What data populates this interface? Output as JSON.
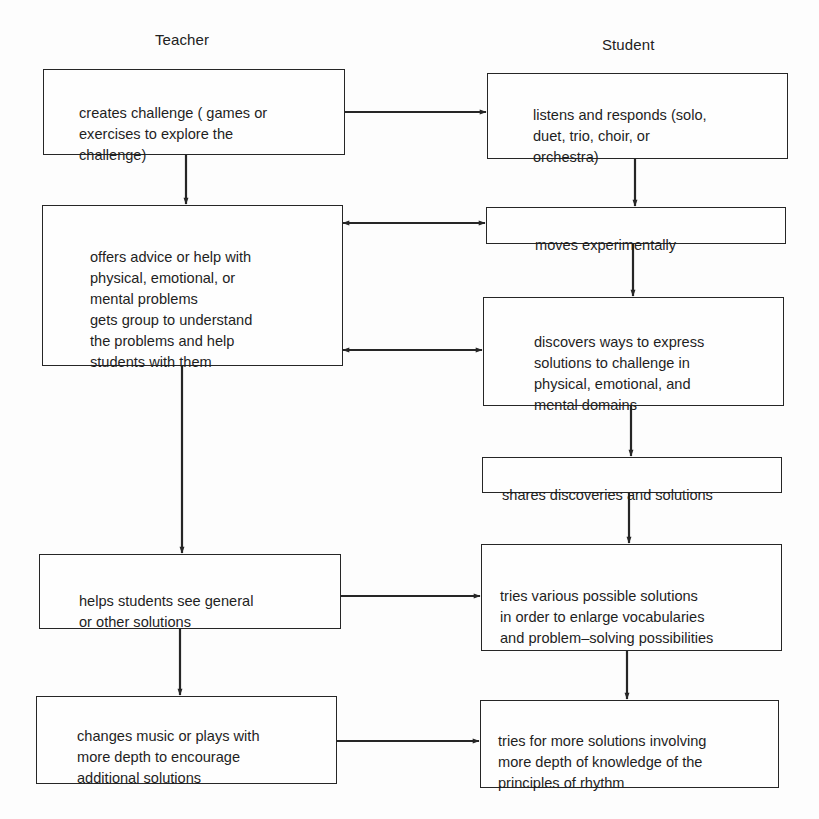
{
  "diagram": {
    "columns": {
      "teacher": "Teacher",
      "student": "Student"
    },
    "teacher_steps": [
      {
        "id": "T1",
        "text": "creates challenge ( games or\nexercises to explore the\nchallenge)"
      },
      {
        "id": "T2",
        "text": "offers advice or help with\nphysical, emotional, or\nmental problems\ngets group to understand\nthe problems and help\nstudents with them"
      },
      {
        "id": "T3",
        "text": "helps students see general\nor other solutions"
      },
      {
        "id": "T4",
        "text": "changes music or plays with\nmore depth to encourage\nadditional solutions"
      }
    ],
    "student_steps": [
      {
        "id": "S1",
        "text": "listens and responds (solo,\nduet, trio, choir, or\norchestra)"
      },
      {
        "id": "S2",
        "text": "moves experimentally"
      },
      {
        "id": "S3",
        "text": "discovers ways to express\nsolutions to challenge in\nphysical, emotional, and\nmental domains"
      },
      {
        "id": "S4",
        "text": "shares discoveries and solutions"
      },
      {
        "id": "S5",
        "text": "tries various possible solutions\nin order to enlarge vocabularies\nand problem–solving possibilities"
      },
      {
        "id": "S6",
        "text": "tries for more solutions involving\nmore depth of knowledge of the\nprinciples of rhythm"
      }
    ],
    "edges": [
      {
        "from": "T1",
        "to": "S1",
        "type": "one-way"
      },
      {
        "from": "T1",
        "to": "T2",
        "type": "one-way"
      },
      {
        "from": "S1",
        "to": "S2",
        "type": "one-way"
      },
      {
        "from": "T2",
        "to": "S2",
        "type": "two-way"
      },
      {
        "from": "S2",
        "to": "S3",
        "type": "one-way"
      },
      {
        "from": "T2",
        "to": "S3",
        "type": "two-way"
      },
      {
        "from": "S3",
        "to": "S4",
        "type": "one-way"
      },
      {
        "from": "T2",
        "to": "T3",
        "type": "one-way"
      },
      {
        "from": "S4",
        "to": "S5",
        "type": "one-way"
      },
      {
        "from": "T3",
        "to": "S5",
        "type": "one-way"
      },
      {
        "from": "T3",
        "to": "T4",
        "type": "one-way"
      },
      {
        "from": "S5",
        "to": "S6",
        "type": "one-way"
      },
      {
        "from": "T4",
        "to": "S6",
        "type": "one-way"
      }
    ],
    "colors": {
      "line": "#262626",
      "background": "#fdfdfd",
      "text": "#1f1f1f"
    }
  }
}
